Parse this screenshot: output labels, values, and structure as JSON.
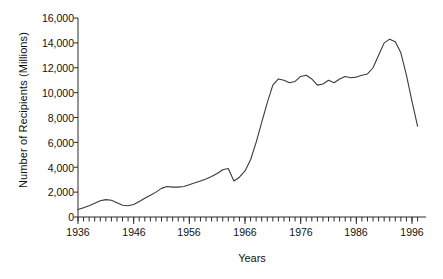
{
  "chart_data": {
    "type": "line",
    "title": "",
    "xlabel": "Years",
    "ylabel": "Number of Recipients (Millions)",
    "xlim": [
      1936,
      1997
    ],
    "ylim": [
      0,
      16000
    ],
    "grid": false,
    "legend": null,
    "y_ticks": [
      0,
      2000,
      4000,
      6000,
      8000,
      10000,
      12000,
      14000,
      16000
    ],
    "y_tick_labels": [
      "0",
      "2,000",
      "4,000",
      "6,000",
      "8,000",
      "10,000",
      "12,000",
      "14,000",
      "16,000"
    ],
    "x_ticks": [
      1936,
      1946,
      1956,
      1966,
      1976,
      1986,
      1996
    ],
    "x_tick_labels": [
      "1936",
      "1946",
      "1956",
      "1966",
      "1976",
      "1986",
      "1996"
    ],
    "x_minor_tick_step": 1,
    "line_color": "#3a3a3a",
    "series": [
      {
        "name": "Number of Recipients",
        "x": [
          1936,
          1937,
          1938,
          1939,
          1940,
          1941,
          1942,
          1943,
          1944,
          1945,
          1946,
          1947,
          1948,
          1949,
          1950,
          1951,
          1952,
          1953,
          1954,
          1955,
          1956,
          1957,
          1958,
          1959,
          1960,
          1961,
          1962,
          1963,
          1964,
          1965,
          1966,
          1967,
          1968,
          1969,
          1970,
          1971,
          1972,
          1973,
          1974,
          1975,
          1976,
          1977,
          1978,
          1979,
          1980,
          1981,
          1982,
          1983,
          1984,
          1985,
          1986,
          1987,
          1988,
          1989,
          1990,
          1991,
          1992,
          1993,
          1994,
          1995,
          1996,
          1997
        ],
        "values": [
          600,
          750,
          900,
          1100,
          1300,
          1400,
          1350,
          1150,
          950,
          900,
          1000,
          1250,
          1500,
          1750,
          2000,
          2300,
          2450,
          2400,
          2400,
          2450,
          2600,
          2750,
          2900,
          3050,
          3250,
          3500,
          3800,
          3900,
          2900,
          3200,
          3700,
          4600,
          6000,
          7600,
          9200,
          10600,
          11100,
          11000,
          10800,
          10900,
          11300,
          11400,
          11100,
          10600,
          10700,
          11000,
          10800,
          11100,
          11300,
          11200,
          11250,
          11400,
          11500,
          12000,
          13000,
          14000,
          14300,
          14100,
          13200,
          11400,
          9300,
          7300
        ]
      }
    ]
  }
}
